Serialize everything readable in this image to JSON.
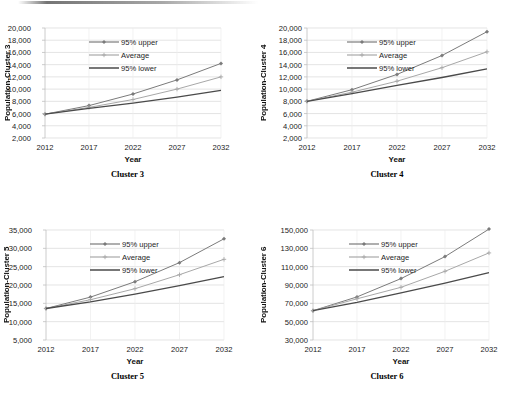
{
  "figure": {
    "panel_count": 4,
    "series_names": [
      "95% upper",
      "Average",
      "95% lower"
    ],
    "colors": {
      "upper": "#7b7b7b",
      "average": "#a8a8a8",
      "lower": "#4a4a4a",
      "grid": "#d9d9d9",
      "axis": "#bfbfbf",
      "text": "#1a1a1a",
      "background": "#ffffff"
    }
  },
  "chart_data": [
    {
      "type": "line",
      "title": "Cluster 3",
      "xlabel": "Year",
      "ylabel": "Population-Cluster 3",
      "x": [
        2012,
        2017,
        2022,
        2027,
        2032
      ],
      "xticklabels": [
        "2012",
        "2017",
        "2022",
        "2027",
        "2032"
      ],
      "ylim": [
        2000,
        20000
      ],
      "yticks": [
        2000,
        4000,
        6000,
        8000,
        10000,
        12000,
        14000,
        16000,
        18000,
        20000
      ],
      "yticklabels": [
        "2,000",
        "4,000",
        "6,000",
        "8,000",
        "10,000",
        "12,000",
        "14,000",
        "16,000",
        "18,000",
        "20,000"
      ],
      "grid": true,
      "legend": [
        "95% upper",
        "Average",
        "95% lower"
      ],
      "legend_position": "upper-left-inside",
      "series": [
        {
          "name": "95% upper",
          "values": [
            5900,
            7300,
            9200,
            11500,
            14200
          ]
        },
        {
          "name": "Average",
          "values": [
            5900,
            7000,
            8300,
            10000,
            12000
          ]
        },
        {
          "name": "95% lower",
          "values": [
            5900,
            6850,
            7700,
            8700,
            9800
          ]
        }
      ]
    },
    {
      "type": "line",
      "title": "Cluster 4",
      "xlabel": "Year",
      "ylabel": "Population-Cluster 4",
      "x": [
        2012,
        2017,
        2022,
        2027,
        2032
      ],
      "xticklabels": [
        "2012",
        "2017",
        "2022",
        "2027",
        "2032"
      ],
      "ylim": [
        2000,
        20000
      ],
      "yticks": [
        2000,
        4000,
        6000,
        8000,
        10000,
        12000,
        14000,
        16000,
        18000,
        20000
      ],
      "yticklabels": [
        "2,000",
        "4,000",
        "6,000",
        "8,000",
        "10,000",
        "12,000",
        "14,000",
        "16,000",
        "18,000",
        "20,000"
      ],
      "grid": true,
      "legend": [
        "95% upper",
        "Average",
        "95% lower"
      ],
      "legend_position": "upper-left-inside",
      "series": [
        {
          "name": "95% upper",
          "values": [
            8000,
            9900,
            12400,
            15500,
            19400
          ]
        },
        {
          "name": "Average",
          "values": [
            8000,
            9500,
            11300,
            13500,
            16100
          ]
        },
        {
          "name": "95% lower",
          "values": [
            8000,
            9250,
            10600,
            11900,
            13300
          ]
        }
      ]
    },
    {
      "type": "line",
      "title": "Cluster 5",
      "xlabel": "Year",
      "ylabel": "Population-Cluster 5",
      "x": [
        2012,
        2017,
        2022,
        2027,
        2032
      ],
      "xticklabels": [
        "2012",
        "2017",
        "2022",
        "2027",
        "2032"
      ],
      "ylim": [
        5000,
        35000
      ],
      "yticks": [
        5000,
        10000,
        15000,
        20000,
        25000,
        30000,
        35000
      ],
      "yticklabels": [
        "5,000",
        "10,000",
        "15,000",
        "20,000",
        "25,000",
        "30,000",
        "35,000"
      ],
      "grid": true,
      "legend": [
        "95% upper",
        "Average",
        "95% lower"
      ],
      "legend_position": "upper-left-inside",
      "series": [
        {
          "name": "95% upper",
          "values": [
            13600,
            16700,
            20900,
            26100,
            32600
          ]
        },
        {
          "name": "Average",
          "values": [
            13600,
            16000,
            19000,
            22800,
            27000
          ]
        },
        {
          "name": "95% lower",
          "values": [
            13600,
            15400,
            17500,
            19800,
            22300
          ]
        }
      ]
    },
    {
      "type": "line",
      "title": "Cluster 6",
      "xlabel": "Year",
      "ylabel": "Population-Cluster 6",
      "x": [
        2012,
        2017,
        2022,
        2027,
        2032
      ],
      "xticklabels": [
        "2012",
        "2017",
        "2022",
        "2027",
        "2032"
      ],
      "ylim": [
        30000,
        150000
      ],
      "yticks": [
        30000,
        50000,
        70000,
        90000,
        110000,
        130000,
        150000
      ],
      "yticklabels": [
        "30,000",
        "50,000",
        "70,000",
        "90,000",
        "110,000",
        "130,000",
        "150,000"
      ],
      "grid": true,
      "legend": [
        "95% upper",
        "Average",
        "95% lower"
      ],
      "legend_position": "upper-left-inside",
      "series": [
        {
          "name": "95% upper",
          "values": [
            62000,
            77000,
            97000,
            121000,
            151000
          ]
        },
        {
          "name": "Average",
          "values": [
            62000,
            75000,
            87500,
            105000,
            125000
          ]
        },
        {
          "name": "95% lower",
          "values": [
            62000,
            71000,
            81500,
            92000,
            103500
          ]
        }
      ]
    }
  ]
}
